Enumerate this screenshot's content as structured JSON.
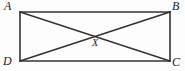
{
  "figure": {
    "kind": "geometry-diagram",
    "background_color": "#fdfdfd",
    "stroke_color": "#333333",
    "label_color": "#1a1a1a",
    "rectangle": {
      "left": 20,
      "top": 12,
      "right": 170,
      "bottom": 61,
      "width": 150,
      "height": 49,
      "stroke_width": 1.6
    },
    "vertices": [
      {
        "id": "A",
        "label": "A",
        "x": 20,
        "y": 12
      },
      {
        "id": "B",
        "label": "B",
        "x": 170,
        "y": 12
      },
      {
        "id": "C",
        "label": "C",
        "x": 170,
        "y": 61
      },
      {
        "id": "D",
        "label": "D",
        "x": 20,
        "y": 61
      }
    ],
    "intersection": {
      "id": "X",
      "label": "X",
      "x": 95,
      "y": 36
    },
    "segments": [
      {
        "name": "top-side",
        "from": "A",
        "to": "B"
      },
      {
        "name": "right-side",
        "from": "B",
        "to": "C"
      },
      {
        "name": "bottom-side",
        "from": "D",
        "to": "C"
      },
      {
        "name": "left-side",
        "from": "A",
        "to": "D"
      },
      {
        "name": "diagonal-a-c",
        "from": "A",
        "to": "C"
      },
      {
        "name": "diagonal-d-b",
        "from": "D",
        "to": "B"
      }
    ]
  }
}
